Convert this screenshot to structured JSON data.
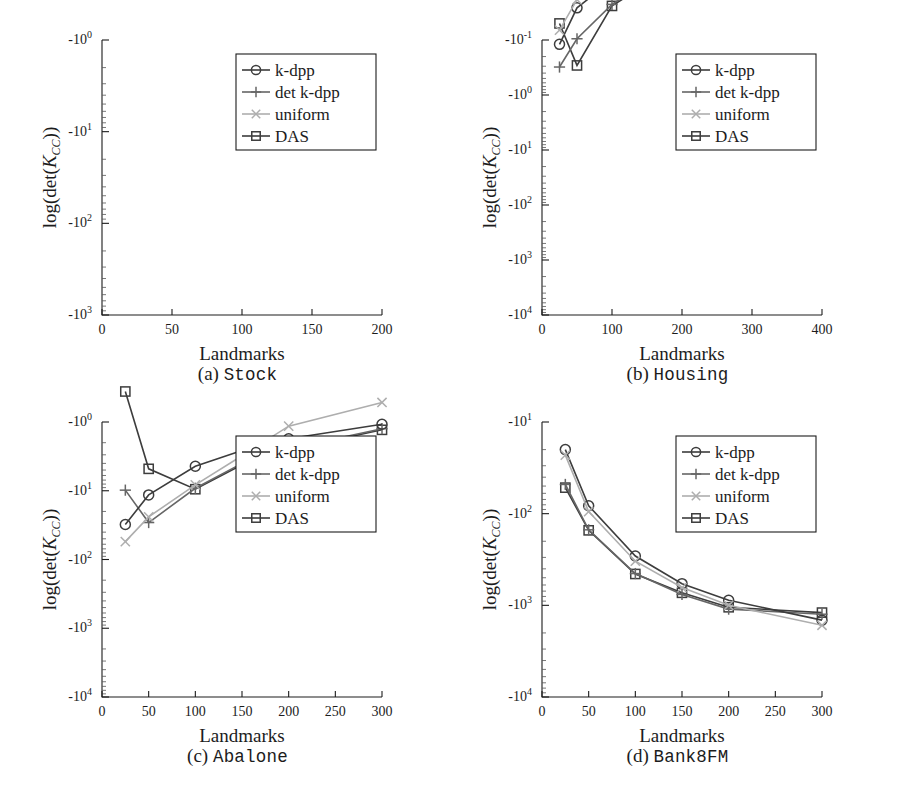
{
  "figure": {
    "panel_count": 4,
    "shared_xlabel": "Landmarks",
    "shared_ylabel": "log(det(Kcc))",
    "ylabel_parts": {
      "prefix": "log(det(",
      "symbol": "K",
      "subscript": "CC",
      "suffix": "))"
    }
  },
  "legend": {
    "position": "upper-right",
    "entries": [
      {
        "label": "k-dpp",
        "marker": "circle",
        "color": "#3d3d3d"
      },
      {
        "label": "det k-dpp",
        "marker": "plus",
        "color": "#666666"
      },
      {
        "label": "uniform",
        "marker": "cross",
        "color": "#aeaeae"
      },
      {
        "label": "DAS",
        "marker": "square",
        "color": "#3d3d3d"
      }
    ]
  },
  "colors": {
    "k_dpp": "#3d3d3d",
    "det_k_dpp": "#666666",
    "uniform": "#aeaeae",
    "das": "#3d3d3d",
    "axis": "#1c1c1c",
    "background": "#ffffff"
  },
  "chart_data": [
    {
      "id": "a",
      "type": "line",
      "title": "(a) Stock",
      "caption_index": "(a)",
      "caption_name": "Stock",
      "xlabel": "Landmarks",
      "ylabel": "log(det(Kcc))",
      "xlim": [
        0,
        200
      ],
      "xticks": [
        0,
        50,
        100,
        150,
        200
      ],
      "xticklabels": [
        "0",
        "50",
        "100",
        "150",
        "200"
      ],
      "yscale": "neg-log",
      "ylim": [
        -1,
        -1000
      ],
      "yticks": [
        -1,
        -10,
        -100,
        -1000
      ],
      "yticklabels": [
        "-10^0",
        "-10^1",
        "-10^2",
        "-10^3"
      ],
      "ytick_mantissa": [
        "-10",
        "-10",
        "-10",
        "-10"
      ],
      "ytick_exponent": [
        "0",
        "1",
        "2",
        "3"
      ],
      "x": [
        25,
        50,
        100,
        150,
        200
      ],
      "series": [
        {
          "name": "k-dpp",
          "values": [
            -0.045,
            -0.0125,
            -0.0042,
            -0.00245,
            -0.00155
          ]
        },
        {
          "name": "det k-dpp",
          "values": [
            -0.108,
            -0.019,
            -0.0048,
            -0.00262,
            -0.00163
          ]
        },
        {
          "name": "uniform",
          "values": [
            -0.034,
            -0.0103,
            -0.0036,
            -0.00215,
            -0.00138
          ]
        },
        {
          "name": "DAS",
          "values": [
            -0.112,
            -0.0195,
            -0.0051,
            -0.0027,
            -0.00168
          ]
        }
      ]
    },
    {
      "id": "b",
      "type": "line",
      "title": "(b) Housing",
      "caption_index": "(b)",
      "caption_name": "Housing",
      "xlabel": "Landmarks",
      "ylabel": "log(det(Kcc))",
      "xlim": [
        0,
        400
      ],
      "xticks": [
        0,
        100,
        200,
        300,
        400
      ],
      "xticklabels": [
        "0",
        "100",
        "200",
        "300",
        "400"
      ],
      "yscale": "neg-log",
      "ylim": [
        -0.1,
        -10000
      ],
      "yticks": [
        -0.1,
        -1,
        -10,
        -100,
        -1000,
        -10000
      ],
      "yticklabels": [
        "-10^-1",
        "-10^0",
        "-10^1",
        "-10^2",
        "-10^3",
        "-10^4"
      ],
      "ytick_mantissa": [
        "-10",
        "-10",
        "-10",
        "-10",
        "-10",
        "-10"
      ],
      "ytick_exponent": [
        "-1",
        "0",
        "1",
        "2",
        "3",
        "4"
      ],
      "x": [
        25,
        50,
        100,
        150,
        200,
        250,
        300,
        400
      ],
      "series": [
        {
          "name": "k-dpp",
          "values": [
            -0.12,
            -0.026,
            -0.0082,
            -0.0045,
            -0.0028,
            -0.00205,
            -0.00165,
            -0.00112
          ]
        },
        {
          "name": "det k-dpp",
          "values": [
            -0.31,
            -0.095,
            -0.0225,
            -0.0088,
            -0.0042,
            -0.00265,
            -0.00185,
            -0.00118
          ]
        },
        {
          "name": "uniform",
          "values": [
            -0.066,
            -0.0185,
            -0.0062,
            -0.0035,
            -0.0024,
            -0.00178,
            -0.00152,
            -0.00105
          ]
        },
        {
          "name": "DAS",
          "values": [
            -0.05,
            -0.29,
            -0.024,
            -0.0095,
            -0.0045,
            -0.00275,
            -0.00192,
            -0.0012
          ]
        }
      ]
    },
    {
      "id": "c",
      "type": "line",
      "title": "(c) Abalone",
      "caption_index": "(c)",
      "caption_name": "Abalone",
      "xlabel": "Landmarks",
      "ylabel": "log(det(Kcc))",
      "xlim": [
        0,
        300
      ],
      "xticks": [
        0,
        50,
        100,
        150,
        200,
        250,
        300
      ],
      "xticklabels": [
        "0",
        "50",
        "100",
        "150",
        "200",
        "250",
        "300"
      ],
      "yscale": "neg-log",
      "ylim": [
        -1,
        -10000
      ],
      "yticks": [
        -1,
        -10,
        -100,
        -1000,
        -10000
      ],
      "yticklabels": [
        "-10^0",
        "-10^1",
        "-10^2",
        "-10^3",
        "-10^4"
      ],
      "ytick_mantissa": [
        "-10",
        "-10",
        "-10",
        "-10",
        "-10"
      ],
      "ytick_exponent": [
        "0",
        "1",
        "2",
        "3",
        "4"
      ],
      "x": [
        25,
        50,
        100,
        150,
        200,
        300
      ],
      "series": [
        {
          "name": "k-dpp",
          "values": [
            -31,
            -11.5,
            -4.4,
            -2.6,
            -1.75,
            -1.08
          ]
        },
        {
          "name": "det k-dpp",
          "values": [
            -9.8,
            -29,
            -9.2,
            -4.0,
            -2.45,
            -1.25
          ]
        },
        {
          "name": "uniform",
          "values": [
            -55,
            -24,
            -8.2,
            -3.1,
            -1.15,
            -0.52
          ]
        },
        {
          "name": "DAS",
          "values": [
            -0.36,
            -4.8,
            -9.5,
            -4.2,
            -2.55,
            -1.3
          ]
        }
      ]
    },
    {
      "id": "d",
      "type": "line",
      "title": "(d) Bank8FM",
      "caption_index": "(d)",
      "caption_name": "Bank8FM",
      "xlabel": "Landmarks",
      "ylabel": "log(det(Kcc))",
      "xlim": [
        0,
        300
      ],
      "xticks": [
        0,
        50,
        100,
        150,
        200,
        250,
        300
      ],
      "xticklabels": [
        "0",
        "50",
        "100",
        "150",
        "200",
        "250",
        "300"
      ],
      "yscale": "neg-log",
      "ylim": [
        -10,
        -10000
      ],
      "yticks": [
        -10,
        -100,
        -1000,
        -10000
      ],
      "yticklabels": [
        "-10^1",
        "-10^2",
        "-10^3",
        "-10^4"
      ],
      "ytick_mantissa": [
        "-10",
        "-10",
        "-10",
        "-10"
      ],
      "ytick_exponent": [
        "1",
        "2",
        "3",
        "4"
      ],
      "x": [
        25,
        50,
        100,
        150,
        200,
        300
      ],
      "values_note": "neg-log axis from -10^1 to -10^4",
      "series": [
        {
          "name": "k-dpp",
          "values": [
            -20,
            -82,
            -290,
            -580,
            -880,
            -1450
          ]
        },
        {
          "name": "det k-dpp",
          "values": [
            -48,
            -150,
            -450,
            -760,
            -1100,
            -1250
          ]
        },
        {
          "name": "uniform",
          "values": [
            -23,
            -95,
            -330,
            -640,
            -1000,
            -1650
          ]
        },
        {
          "name": "DAS",
          "values": [
            -52,
            -152,
            -455,
            -730,
            -1050,
            -1200
          ]
        }
      ]
    }
  ]
}
